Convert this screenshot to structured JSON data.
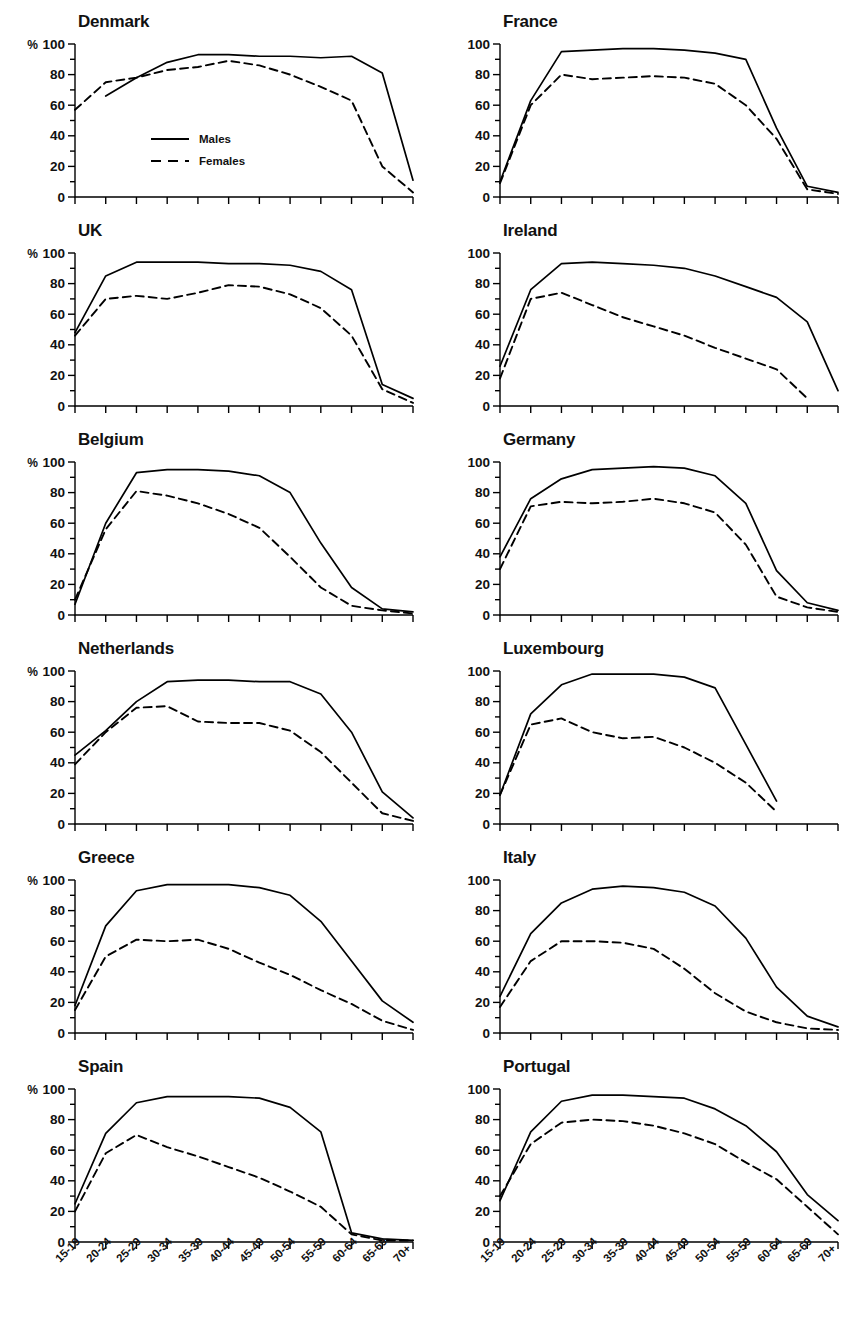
{
  "figure": {
    "legend": {
      "males_label": "Males",
      "females_label": "Females",
      "males_style": "solid",
      "females_style": "dashed"
    },
    "y_axis": {
      "unit_label": "%",
      "ticks": [
        0,
        20,
        40,
        60,
        80,
        100
      ],
      "minor_step": 10,
      "min": 0,
      "max": 100
    },
    "x_axis": {
      "categories": [
        "15-19",
        "20-24",
        "25-29",
        "30-34",
        "35-39",
        "40-44",
        "45-49",
        "50-54",
        "55-59",
        "60-64",
        "65-69",
        "70+"
      ],
      "label_rotation_deg": -45
    },
    "line_color": "#000000",
    "panel_count": 12
  },
  "chart_data": [
    {
      "type": "line",
      "title": "Denmark",
      "xlabel": "",
      "ylabel": "%",
      "ylim": [
        0,
        100
      ],
      "grid": false,
      "legend_position": "inside-center",
      "x": [
        "15-19",
        "20-24",
        "25-29",
        "30-34",
        "35-39",
        "40-44",
        "45-49",
        "50-54",
        "55-59",
        "60-64",
        "65-69",
        "70+"
      ],
      "series": [
        {
          "name": "Males",
          "style": "solid",
          "values": [
            null,
            66,
            78,
            88,
            93,
            93,
            92,
            92,
            91,
            92,
            81,
            11
          ]
        },
        {
          "name": "Females",
          "style": "dashed",
          "values": [
            57,
            75,
            78,
            83,
            85,
            89,
            86,
            80,
            72,
            63,
            20,
            3
          ]
        }
      ]
    },
    {
      "type": "line",
      "title": "France",
      "xlabel": "",
      "ylabel": "",
      "ylim": [
        0,
        100
      ],
      "grid": false,
      "legend_position": "none",
      "x": [
        "15-19",
        "20-24",
        "25-29",
        "30-34",
        "35-39",
        "40-44",
        "45-49",
        "50-54",
        "55-59",
        "60-64",
        "65-69",
        "70+"
      ],
      "series": [
        {
          "name": "Males",
          "style": "solid",
          "values": [
            10,
            63,
            95,
            96,
            97,
            97,
            96,
            94,
            90,
            45,
            7,
            3
          ]
        },
        {
          "name": "Females",
          "style": "dashed",
          "values": [
            9,
            60,
            80,
            77,
            78,
            79,
            78,
            74,
            60,
            38,
            5,
            2
          ]
        }
      ]
    },
    {
      "type": "line",
      "title": "UK",
      "xlabel": "",
      "ylabel": "%",
      "ylim": [
        0,
        100
      ],
      "grid": false,
      "legend_position": "none",
      "x": [
        "15-19",
        "20-24",
        "25-29",
        "30-34",
        "35-39",
        "40-44",
        "45-49",
        "50-54",
        "55-59",
        "60-64",
        "65-69",
        "70+"
      ],
      "series": [
        {
          "name": "Males",
          "style": "solid",
          "values": [
            48,
            85,
            94,
            94,
            94,
            93,
            93,
            92,
            88,
            76,
            14,
            5
          ]
        },
        {
          "name": "Females",
          "style": "dashed",
          "values": [
            46,
            70,
            72,
            70,
            74,
            79,
            78,
            73,
            64,
            46,
            11,
            2
          ]
        }
      ]
    },
    {
      "type": "line",
      "title": "Ireland",
      "xlabel": "",
      "ylabel": "",
      "ylim": [
        0,
        100
      ],
      "grid": false,
      "legend_position": "none",
      "x": [
        "15-19",
        "20-24",
        "25-29",
        "30-34",
        "35-39",
        "40-44",
        "45-49",
        "50-54",
        "55-59",
        "60-64",
        "65-69",
        "70+"
      ],
      "series": [
        {
          "name": "Males",
          "style": "solid",
          "values": [
            26,
            76,
            93,
            94,
            93,
            92,
            90,
            85,
            78,
            71,
            55,
            10
          ]
        },
        {
          "name": "Females",
          "style": "dashed",
          "values": [
            18,
            70,
            74,
            66,
            58,
            52,
            46,
            38,
            31,
            24,
            5,
            null
          ]
        }
      ]
    },
    {
      "type": "line",
      "title": "Belgium",
      "xlabel": "",
      "ylabel": "%",
      "ylim": [
        0,
        100
      ],
      "grid": false,
      "legend_position": "none",
      "x": [
        "15-19",
        "20-24",
        "25-29",
        "30-34",
        "35-39",
        "40-44",
        "45-49",
        "50-54",
        "55-59",
        "60-64",
        "65-69",
        "70+"
      ],
      "series": [
        {
          "name": "Males",
          "style": "solid",
          "values": [
            7,
            60,
            93,
            95,
            95,
            94,
            91,
            80,
            47,
            18,
            4,
            2
          ]
        },
        {
          "name": "Females",
          "style": "dashed",
          "values": [
            10,
            56,
            81,
            78,
            73,
            66,
            57,
            38,
            18,
            6,
            3,
            1
          ]
        }
      ]
    },
    {
      "type": "line",
      "title": "Germany",
      "xlabel": "",
      "ylabel": "",
      "ylim": [
        0,
        100
      ],
      "grid": false,
      "legend_position": "none",
      "x": [
        "15-19",
        "20-24",
        "25-29",
        "30-34",
        "35-39",
        "40-44",
        "45-49",
        "50-54",
        "55-59",
        "60-64",
        "65-69",
        "70+"
      ],
      "series": [
        {
          "name": "Males",
          "style": "solid",
          "values": [
            38,
            76,
            89,
            95,
            96,
            97,
            96,
            91,
            73,
            29,
            8,
            3
          ]
        },
        {
          "name": "Females",
          "style": "dashed",
          "values": [
            30,
            71,
            74,
            73,
            74,
            76,
            73,
            67,
            46,
            12,
            5,
            2
          ]
        }
      ]
    },
    {
      "type": "line",
      "title": "Netherlands",
      "xlabel": "",
      "ylabel": "%",
      "ylim": [
        0,
        100
      ],
      "grid": false,
      "legend_position": "none",
      "x": [
        "15-19",
        "20-24",
        "25-29",
        "30-34",
        "35-39",
        "40-44",
        "45-49",
        "50-54",
        "55-59",
        "60-64",
        "65-69",
        "70+"
      ],
      "series": [
        {
          "name": "Males",
          "style": "solid",
          "values": [
            45,
            61,
            80,
            93,
            94,
            94,
            93,
            93,
            85,
            60,
            21,
            4
          ]
        },
        {
          "name": "Females",
          "style": "dashed",
          "values": [
            39,
            60,
            76,
            77,
            67,
            66,
            66,
            61,
            47,
            27,
            7,
            2
          ]
        }
      ]
    },
    {
      "type": "line",
      "title": "Luxembourg",
      "xlabel": "",
      "ylabel": "",
      "ylim": [
        0,
        100
      ],
      "grid": false,
      "legend_position": "none",
      "x": [
        "15-19",
        "20-24",
        "25-29",
        "30-34",
        "35-39",
        "40-44",
        "45-49",
        "50-54",
        "55-59",
        "60-64",
        "65-69",
        "70+"
      ],
      "series": [
        {
          "name": "Males",
          "style": "solid",
          "values": [
            19,
            72,
            91,
            98,
            98,
            98,
            96,
            89,
            52,
            15,
            null,
            null
          ]
        },
        {
          "name": "Females",
          "style": "dashed",
          "values": [
            19,
            65,
            69,
            60,
            56,
            57,
            50,
            40,
            27,
            8,
            null,
            null
          ]
        }
      ]
    },
    {
      "type": "line",
      "title": "Greece",
      "xlabel": "",
      "ylabel": "%",
      "ylim": [
        0,
        100
      ],
      "grid": false,
      "legend_position": "none",
      "x": [
        "15-19",
        "20-24",
        "25-29",
        "30-34",
        "35-39",
        "40-44",
        "45-49",
        "50-54",
        "55-59",
        "60-64",
        "65-69",
        "70+"
      ],
      "series": [
        {
          "name": "Males",
          "style": "solid",
          "values": [
            18,
            70,
            93,
            97,
            97,
            97,
            95,
            90,
            73,
            47,
            21,
            7
          ]
        },
        {
          "name": "Females",
          "style": "dashed",
          "values": [
            15,
            50,
            61,
            60,
            61,
            55,
            46,
            38,
            28,
            19,
            8,
            2
          ]
        }
      ]
    },
    {
      "type": "line",
      "title": "Italy",
      "xlabel": "",
      "ylabel": "",
      "ylim": [
        0,
        100
      ],
      "grid": false,
      "legend_position": "none",
      "x": [
        "15-19",
        "20-24",
        "25-29",
        "30-34",
        "35-39",
        "40-44",
        "45-49",
        "50-54",
        "55-59",
        "60-64",
        "65-69",
        "70+"
      ],
      "series": [
        {
          "name": "Males",
          "style": "solid",
          "values": [
            24,
            65,
            85,
            94,
            96,
            95,
            92,
            83,
            62,
            30,
            11,
            4
          ]
        },
        {
          "name": "Females",
          "style": "dashed",
          "values": [
            17,
            47,
            60,
            60,
            59,
            55,
            42,
            26,
            14,
            7,
            3,
            2
          ]
        }
      ]
    },
    {
      "type": "line",
      "title": "Spain",
      "xlabel": "",
      "ylabel": "%",
      "ylim": [
        0,
        100
      ],
      "grid": false,
      "legend_position": "none",
      "x": [
        "15-19",
        "20-24",
        "25-29",
        "30-34",
        "35-39",
        "40-44",
        "45-49",
        "50-54",
        "55-59",
        "60-64",
        "65-69",
        "70+"
      ],
      "series": [
        {
          "name": "Males",
          "style": "solid",
          "values": [
            25,
            71,
            91,
            95,
            95,
            95,
            94,
            88,
            72,
            6,
            2,
            1
          ]
        },
        {
          "name": "Females",
          "style": "dashed",
          "values": [
            20,
            58,
            70,
            62,
            56,
            49,
            42,
            33,
            23,
            5,
            1,
            1
          ]
        }
      ]
    },
    {
      "type": "line",
      "title": "Portugal",
      "xlabel": "",
      "ylabel": "",
      "ylim": [
        0,
        100
      ],
      "grid": false,
      "legend_position": "none",
      "x": [
        "15-19",
        "20-24",
        "25-29",
        "30-34",
        "35-39",
        "40-44",
        "45-49",
        "50-54",
        "55-59",
        "60-64",
        "65-69",
        "70+"
      ],
      "series": [
        {
          "name": "Males",
          "style": "solid",
          "values": [
            27,
            72,
            92,
            96,
            96,
            95,
            94,
            87,
            76,
            59,
            31,
            14
          ]
        },
        {
          "name": "Females",
          "style": "dashed",
          "values": [
            30,
            64,
            78,
            80,
            79,
            76,
            71,
            64,
            52,
            41,
            23,
            5
          ]
        }
      ]
    }
  ]
}
